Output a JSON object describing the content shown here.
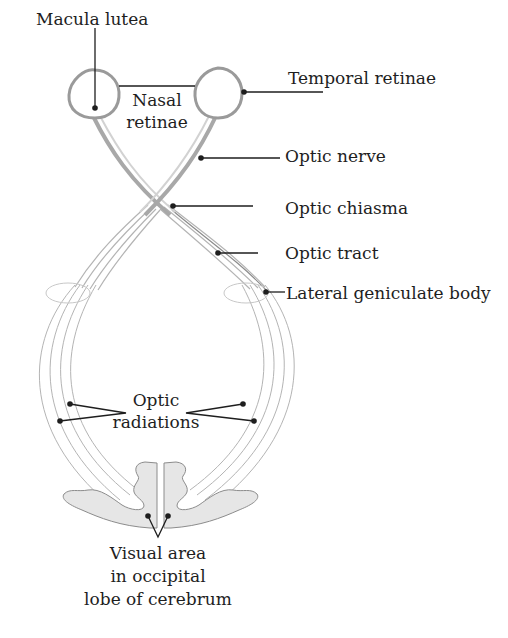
{
  "diagram": {
    "colors": {
      "outline": "#8c8c8c",
      "fiber": "#b4b4b4",
      "fiber_dark": "#9a9a9a",
      "cortex_fill": "#e6e6e6",
      "leader": "#1e1e1e",
      "text": "#1e1e1e"
    },
    "labels": {
      "macula_lutea": "Macula lutea",
      "nasal_retinae_line1": "Nasal",
      "nasal_retinae_line2": "retinae",
      "temporal_retinae": "Temporal retinae",
      "optic_nerve": "Optic nerve",
      "optic_chiasma": "Optic chiasma",
      "optic_tract": "Optic tract",
      "lateral_geniculate_body": "Lateral geniculate body",
      "optic_radiations_line1": "Optic",
      "optic_radiations_line2": "radiations",
      "visual_area_line1": "Visual area",
      "visual_area_line2": "in occipital",
      "visual_area_line3": "lobe of cerebrum"
    }
  }
}
